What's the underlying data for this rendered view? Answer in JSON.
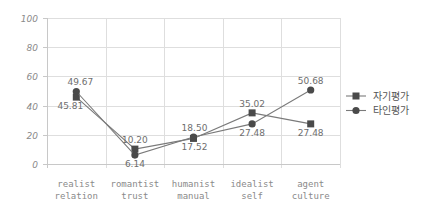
{
  "chart_data": {
    "type": "line",
    "title": "",
    "xlabel": "",
    "ylabel": "",
    "categories": [
      [
        "realist",
        "relation"
      ],
      [
        "romantist",
        "trust"
      ],
      [
        "humanist",
        "manual"
      ],
      [
        "idealist",
        "self"
      ],
      [
        "agent",
        "culture"
      ]
    ],
    "series": [
      {
        "name": "자기평가",
        "marker": "square",
        "values": [
          45.81,
          10.2,
          17.52,
          35.02,
          27.48
        ],
        "labels": [
          "45.81",
          "10.20",
          "17.52",
          "35.02",
          "27.48"
        ]
      },
      {
        "name": "타인평가",
        "marker": "circle",
        "values": [
          49.67,
          6.14,
          18.5,
          27.48,
          50.68
        ],
        "labels": [
          "49.67",
          "6.14",
          "18.50",
          "27.48",
          "50.68"
        ]
      }
    ],
    "ylim": [
      0,
      100
    ],
    "yticks": [
      0,
      20,
      40,
      60,
      80,
      100
    ],
    "ytick_labels": [
      "0",
      "20",
      "40",
      "60",
      "80",
      "100"
    ],
    "grid": true,
    "legend_position": "right"
  },
  "colors": {
    "line": "#7a7a7a",
    "marker": "#4a4a4a",
    "grid": "#dedede",
    "text": "#8a8a8a"
  }
}
